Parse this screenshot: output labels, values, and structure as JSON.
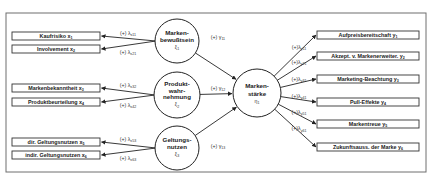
{
  "diagram": {
    "type": "structural-equation-model",
    "frame": {
      "x": 6,
      "y": 13,
      "w": 420,
      "h": 159,
      "color": "#6e6e6e"
    },
    "exogenous_constructs": [
      {
        "id": "xi1",
        "label_line1": "Marken-",
        "label_line2": "bewußtsein",
        "label_line3": "",
        "symbol": "ξ",
        "symbol_sub": "1",
        "cx": 177,
        "cy": 41,
        "r": 22
      },
      {
        "id": "xi2",
        "label_line1": "Produkt-",
        "label_line2": "wahr-",
        "label_line3": "nehmung",
        "symbol": "ξ",
        "symbol_sub": "2",
        "cx": 177,
        "cy": 95,
        "r": 23
      },
      {
        "id": "xi3",
        "label_line1": "Geltungs-",
        "label_line2": "nutzen",
        "label_line3": "",
        "symbol": "ξ",
        "symbol_sub": "3",
        "cx": 177,
        "cy": 148,
        "r": 22
      }
    ],
    "endogenous_construct": {
      "id": "eta1",
      "label_line1": "Marken-",
      "label_line2": "stärke",
      "symbol": "η",
      "symbol_sub": "1",
      "cx": 257,
      "cy": 93,
      "r": 24
    },
    "x_indicators": [
      {
        "label": "Kaufrisiko x",
        "sub": "1",
        "y": 32,
        "coef": "(+) λ",
        "coef_sub": "x11",
        "parent": 0
      },
      {
        "label": "Involvement x",
        "sub": "2",
        "y": 45,
        "coef": "(+) λ",
        "coef_sub": "x21",
        "parent": 0
      },
      {
        "label": "Markenbekanntheit x",
        "sub": "3",
        "y": 84,
        "coef": "(+) λ",
        "coef_sub": "x32",
        "parent": 1
      },
      {
        "label": "Produktbeurteilung x",
        "sub": "4",
        "y": 98,
        "coef": "(+) λ",
        "coef_sub": "x42",
        "parent": 1
      },
      {
        "label": "dir. Geltungsnutzen x",
        "sub": "5",
        "y": 138,
        "coef": "(+) λ",
        "coef_sub": "x53",
        "parent": 2
      },
      {
        "label": "indir. Geltungsnutzen x",
        "sub": "6",
        "y": 151,
        "coef": "(+) λ",
        "coef_sub": "x63",
        "parent": 2
      }
    ],
    "y_indicators": [
      {
        "label": "Aufpreisbereitschaft y",
        "sub": "1",
        "y": 31,
        "coef": "(+)λ",
        "coef_sub": "y11"
      },
      {
        "label": "Akzept. v. Markenerweiter. y",
        "sub": "2",
        "y": 52,
        "coef": "(+)λ",
        "coef_sub": "y21"
      },
      {
        "label": "Marketing-Beachtung y",
        "sub": "3",
        "y": 75,
        "coef": "(+)λ",
        "coef_sub": "y31"
      },
      {
        "label": "Pull-Effekte y",
        "sub": "4",
        "y": 98,
        "coef": "(+)λ",
        "coef_sub": "y41"
      },
      {
        "label": "Markentreue y",
        "sub": "5",
        "y": 120,
        "coef": "(+)λ",
        "coef_sub": "y51"
      },
      {
        "label": "Zukunftsauss. der Marke y",
        "sub": "6",
        "y": 143,
        "coef": "(+)λ",
        "coef_sub": "y61"
      }
    ],
    "structural_paths": [
      {
        "from": 0,
        "coef": "(+) γ",
        "coef_sub": "11"
      },
      {
        "from": 1,
        "coef": "(+) γ",
        "coef_sub": "12"
      },
      {
        "from": 2,
        "coef": "(+) γ",
        "coef_sub": "13"
      }
    ],
    "colors": {
      "line": "#222222",
      "box_border": "#333333",
      "text": "#222222"
    }
  }
}
